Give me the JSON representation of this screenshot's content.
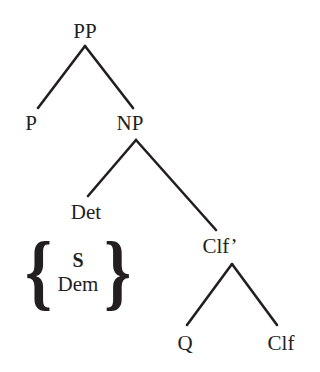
{
  "diagram": {
    "type": "syntax-tree",
    "background_color": "#ffffff",
    "line_color": "#231f20",
    "text_color": "#231f20",
    "line_width": 2.6,
    "nodes": [
      {
        "id": "pp",
        "label": "PP",
        "x": 85,
        "y": 31
      },
      {
        "id": "p",
        "label": "P",
        "x": 31,
        "y": 123
      },
      {
        "id": "np",
        "label": "NP",
        "x": 130,
        "y": 123
      },
      {
        "id": "det",
        "label": "Det",
        "x": 86,
        "y": 212
      },
      {
        "id": "clfb",
        "label": "Clf’",
        "x": 220,
        "y": 246
      },
      {
        "id": "q",
        "label": "Q",
        "x": 185,
        "y": 343
      },
      {
        "id": "clf",
        "label": "Clf",
        "x": 281,
        "y": 343
      }
    ],
    "alternation_set": {
      "left_brace": "{",
      "right_brace": "}",
      "options": [
        "S",
        "Dem"
      ]
    },
    "edges": [
      {
        "from": "pp",
        "to": "p",
        "x1": 85,
        "y1": 46,
        "x2": 38,
        "y2": 108
      },
      {
        "from": "pp",
        "to": "np",
        "x1": 85,
        "y1": 46,
        "x2": 133,
        "y2": 108
      },
      {
        "from": "np",
        "to": "det",
        "x1": 136,
        "y1": 140,
        "x2": 88,
        "y2": 196
      },
      {
        "from": "np",
        "to": "clfb",
        "x1": 136,
        "y1": 140,
        "x2": 216,
        "y2": 230
      },
      {
        "from": "clfb",
        "to": "q",
        "x1": 232,
        "y1": 264,
        "x2": 187,
        "y2": 325
      },
      {
        "from": "clfb",
        "to": "clf",
        "x1": 232,
        "y1": 264,
        "x2": 277,
        "y2": 325
      }
    ]
  }
}
